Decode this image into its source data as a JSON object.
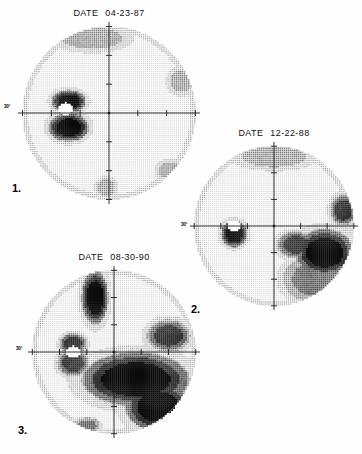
{
  "figure": {
    "title_prefix": "DATE",
    "axis_degree_label": "30°",
    "panels": [
      {
        "index_label": "1.",
        "date_label": "DATE",
        "date_value": "04-23-87",
        "eye_field": "right",
        "x": 18,
        "y": 8,
        "size": 182,
        "summary": "Early field with small dense arcuate scotoma nasal-inferior to fixation"
      },
      {
        "index_label": "2.",
        "date_label": "DATE",
        "date_value": "12-22-88",
        "eye_field": "right",
        "x": 190,
        "y": 128,
        "size": 168,
        "summary": "Progression with dense inferior-temporal loss and expanding arcuate defect"
      },
      {
        "index_label": "3.",
        "date_label": "DATE",
        "date_value": "08-30-90",
        "eye_field": "right",
        "x": 28,
        "y": 252,
        "size": 172,
        "summary": "Advanced loss: dense inferior hemifield defect plus superior arcuate extension"
      }
    ]
  },
  "chart_data": [
    {
      "type": "heatmap",
      "title": "DATE 04-23-87",
      "xlabel": "",
      "ylabel": "",
      "grid": true,
      "legend": "none",
      "xlim": [
        -30,
        30
      ],
      "ylim": [
        -30,
        30
      ],
      "axis_tick_label": "30°",
      "colormap": "grayscale-stipple",
      "levels": [
        0,
        1,
        2,
        3,
        4,
        5
      ],
      "level_meaning": [
        "normal",
        "mild",
        "moderate",
        "marked",
        "severe",
        "absolute"
      ],
      "blind_spot": {
        "x": -15,
        "y": 1.5,
        "present": true
      },
      "defects": [
        {
          "name": "paracentral-scotoma-upper",
          "cx": -14,
          "cy": 4,
          "rx": 6,
          "ry": 4,
          "level": 5
        },
        {
          "name": "paracentral-scotoma-lower",
          "cx": -14,
          "cy": -5,
          "rx": 7,
          "ry": 5,
          "level": 5
        },
        {
          "name": "superior-rim-depression",
          "cx": -6,
          "cy": 26,
          "rx": 14,
          "ry": 5,
          "level": 2
        },
        {
          "name": "temporal-edge-depression",
          "cx": 25,
          "cy": 11,
          "rx": 5,
          "ry": 5,
          "level": 2
        },
        {
          "name": "inferior-temporal-edge",
          "cx": 21,
          "cy": -20,
          "rx": 5,
          "ry": 4,
          "level": 2
        },
        {
          "name": "inferior-rim-depression",
          "cx": -1,
          "cy": -26,
          "rx": 4,
          "ry": 4,
          "level": 2
        }
      ]
    },
    {
      "type": "heatmap",
      "title": "DATE 12-22-88",
      "xlabel": "",
      "ylabel": "",
      "grid": true,
      "legend": "none",
      "xlim": [
        -30,
        30
      ],
      "ylim": [
        -30,
        30
      ],
      "axis_tick_label": "30°",
      "colormap": "grayscale-stipple",
      "levels": [
        0,
        1,
        2,
        3,
        4,
        5
      ],
      "level_meaning": [
        "normal",
        "mild",
        "moderate",
        "marked",
        "severe",
        "absolute"
      ],
      "blind_spot": {
        "x": -15,
        "y": 0,
        "present": true
      },
      "defects": [
        {
          "name": "blind-spot-enlargement",
          "cx": -15,
          "cy": -3,
          "rx": 5,
          "ry": 5,
          "level": 5
        },
        {
          "name": "inferior-nasal-step",
          "cx": 8,
          "cy": -7,
          "rx": 7,
          "ry": 5,
          "level": 4
        },
        {
          "name": "inferior-arcuate-dense",
          "cx": 19,
          "cy": -10,
          "rx": 11,
          "ry": 9,
          "level": 5
        },
        {
          "name": "inferior-arcuate-spread",
          "cx": 15,
          "cy": -20,
          "rx": 12,
          "ry": 9,
          "level": 3
        },
        {
          "name": "temporal-superior-notch",
          "cx": 26,
          "cy": 6,
          "rx": 5,
          "ry": 6,
          "level": 4
        },
        {
          "name": "superior-rim-depression",
          "cx": 0,
          "cy": 26,
          "rx": 16,
          "ry": 5,
          "level": 2
        }
      ]
    },
    {
      "type": "heatmap",
      "title": "DATE 08-30-90",
      "xlabel": "",
      "ylabel": "",
      "grid": true,
      "legend": "none",
      "xlim": [
        -30,
        30
      ],
      "ylim": [
        -30,
        30
      ],
      "axis_tick_label": "30°",
      "colormap": "grayscale-stipple",
      "levels": [
        0,
        1,
        2,
        3,
        4,
        5
      ],
      "level_meaning": [
        "normal",
        "mild",
        "moderate",
        "marked",
        "severe",
        "absolute"
      ],
      "blind_spot": {
        "x": -15,
        "y": 0,
        "present": true
      },
      "defects": [
        {
          "name": "superior-arcuate-band",
          "cx": -7,
          "cy": 20,
          "rx": 5,
          "ry": 10,
          "level": 5
        },
        {
          "name": "blind-spot-enlargement",
          "cx": -15,
          "cy": 3,
          "rx": 5,
          "ry": 4,
          "level": 4
        },
        {
          "name": "nasal-step-inferior",
          "cx": -15,
          "cy": -4,
          "rx": 6,
          "ry": 5,
          "level": 4
        },
        {
          "name": "inferior-hemifield-dense",
          "cx": 8,
          "cy": -10,
          "rx": 20,
          "ry": 10,
          "level": 5
        },
        {
          "name": "inferior-temporal-absolute",
          "cx": 16,
          "cy": -20,
          "rx": 12,
          "ry": 9,
          "level": 5
        },
        {
          "name": "temporal-superior-notch",
          "cx": 20,
          "cy": 6,
          "rx": 8,
          "ry": 6,
          "level": 4
        },
        {
          "name": "inferior-edge-island",
          "cx": -10,
          "cy": -27,
          "rx": 5,
          "ry": 3,
          "level": 3
        }
      ]
    }
  ],
  "colors": {
    "background": "#ffffff",
    "ink": "#000000",
    "axis": "#1a1a1a",
    "stipple_light": "#b9b9b9",
    "stipple_mid": "#6e6e6e",
    "stipple_dark": "#2b2b2b"
  }
}
